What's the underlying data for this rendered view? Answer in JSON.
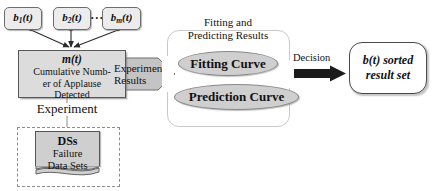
{
  "diagram": {
    "inputs": [
      {
        "label": "b",
        "subscript": "1",
        "suffix": "(t)"
      },
      {
        "label": "b",
        "subscript": "2",
        "suffix": "(t)"
      },
      {
        "label": "b",
        "subscript": "m",
        "suffix": "(t)"
      }
    ],
    "input_ellipsis": "···",
    "cumulative": {
      "symbol": "m(t)",
      "line1": "Cumulative Numb-",
      "line2": "er of Applause",
      "line3": "Detected"
    },
    "experiment_label": "Experiment",
    "datasets": {
      "title": "DSs",
      "line1": "Failure",
      "line2": "Data Sets"
    },
    "experimental_arrow": {
      "line1": "Experimental",
      "line2": "Results"
    },
    "fitting_group": {
      "header_line1": "Fitting and",
      "header_line2": "Predicting Results",
      "curves": [
        {
          "label": "Fitting Curve"
        },
        {
          "label": "Prediction Curve"
        }
      ]
    },
    "decision_label": "Decision",
    "result": {
      "line1": "b(t) sorted",
      "line2": "result set"
    },
    "colors": {
      "input_fill": "#ececed",
      "cumulative_fill": "#dcdcdc",
      "dataset_fill": "#cfcfcf",
      "pill_fill": "#cfcfcf",
      "arrow_fill": "#c4c4c4",
      "decision_arrow": "#1b1b1b",
      "stroke": "#555555",
      "background": "#ffffff"
    }
  }
}
